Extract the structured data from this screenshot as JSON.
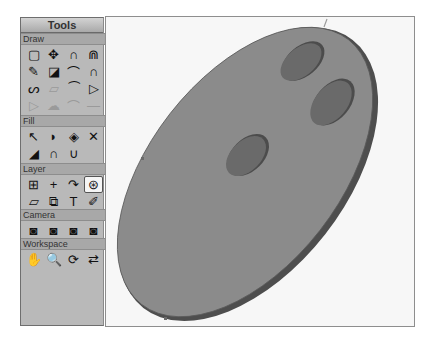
{
  "panel": {
    "title": "Tools",
    "sections": [
      {
        "label": "Draw",
        "tools": [
          {
            "name": "rectangle-select-icon",
            "glyph": "▢",
            "dim": false
          },
          {
            "name": "move-icon",
            "glyph": "✥",
            "dim": false
          },
          {
            "name": "arc-icon",
            "glyph": "∩",
            "dim": false
          },
          {
            "name": "double-arc-icon",
            "glyph": "⋒",
            "dim": false
          },
          {
            "name": "pencil-icon",
            "glyph": "✎",
            "dim": false
          },
          {
            "name": "shapes-icon",
            "glyph": "◪",
            "dim": false
          },
          {
            "name": "bezier-curve-icon",
            "glyph": "⌒",
            "dim": false
          },
          {
            "name": "magnet-icon",
            "glyph": "∩",
            "dim": false
          },
          {
            "name": "freehand-curve-icon",
            "glyph": "ᔕ",
            "dim": false
          },
          {
            "name": "eraser-icon",
            "glyph": "▱",
            "dim": true
          },
          {
            "name": "node-arc-icon",
            "glyph": "⁀",
            "dim": false
          },
          {
            "name": "triangles-icon",
            "glyph": "▷",
            "dim": false
          },
          {
            "name": "trapezoid-icon",
            "glyph": "▷",
            "dim": true
          },
          {
            "name": "cloud-shape-icon",
            "glyph": "☁",
            "dim": true
          },
          {
            "name": "curve-dim-icon",
            "glyph": "⌒",
            "dim": true
          },
          {
            "name": "line-dim-icon",
            "glyph": "—",
            "dim": true
          }
        ]
      },
      {
        "label": "Fill",
        "tools": [
          {
            "name": "select-fill-icon",
            "glyph": "↖",
            "dim": false
          },
          {
            "name": "blob-fill-icon",
            "glyph": "◗",
            "dim": false
          },
          {
            "name": "paint-bucket-icon",
            "glyph": "◈",
            "dim": false
          },
          {
            "name": "delete-fill-icon",
            "glyph": "✕",
            "dim": false
          },
          {
            "name": "gradient-icon",
            "glyph": "◢",
            "dim": false
          },
          {
            "name": "arc-fill-icon",
            "glyph": "∩",
            "dim": false
          },
          {
            "name": "wave-fill-icon",
            "glyph": "∪",
            "dim": false
          }
        ]
      },
      {
        "label": "Layer",
        "tools": [
          {
            "name": "add-layer-icon",
            "glyph": "⊞",
            "dim": false
          },
          {
            "name": "crosshair-icon",
            "glyph": "+",
            "dim": false
          },
          {
            "name": "rotate-layer-icon",
            "glyph": "↷",
            "dim": false
          },
          {
            "name": "layer-stack-icon",
            "glyph": "⊛",
            "dim": false,
            "selected": true
          },
          {
            "name": "plane-icon",
            "glyph": "▱",
            "dim": false
          },
          {
            "name": "layer-group-icon",
            "glyph": "⧉",
            "dim": false
          },
          {
            "name": "text-icon",
            "glyph": "T",
            "dim": false
          },
          {
            "name": "eyedropper-icon",
            "glyph": "✐",
            "dim": false
          }
        ]
      },
      {
        "label": "Camera",
        "tools": [
          {
            "name": "camera-pan-icon",
            "glyph": "◙",
            "dim": false
          },
          {
            "name": "camera-up-icon",
            "glyph": "◙",
            "dim": false
          },
          {
            "name": "camera-orbit-icon",
            "glyph": "◙",
            "dim": false
          },
          {
            "name": "camera-zoom-icon",
            "glyph": "◙",
            "dim": false
          }
        ]
      },
      {
        "label": "Workspace",
        "tools": [
          {
            "name": "hand-icon",
            "glyph": "✋",
            "dim": false
          },
          {
            "name": "zoom-icon",
            "glyph": "🔍",
            "dim": false
          },
          {
            "name": "rotate-view-icon",
            "glyph": "⟳",
            "dim": false
          },
          {
            "name": "reset-view-icon",
            "glyph": "⇄",
            "dim": false
          }
        ]
      }
    ]
  },
  "canvas": {
    "background": "#f7f7f7",
    "disc": {
      "fill": "#8a8a8a",
      "rim": "#555555"
    },
    "holes": {
      "fill": "#6a6a6a",
      "rim": "#4a4a4a"
    }
  }
}
